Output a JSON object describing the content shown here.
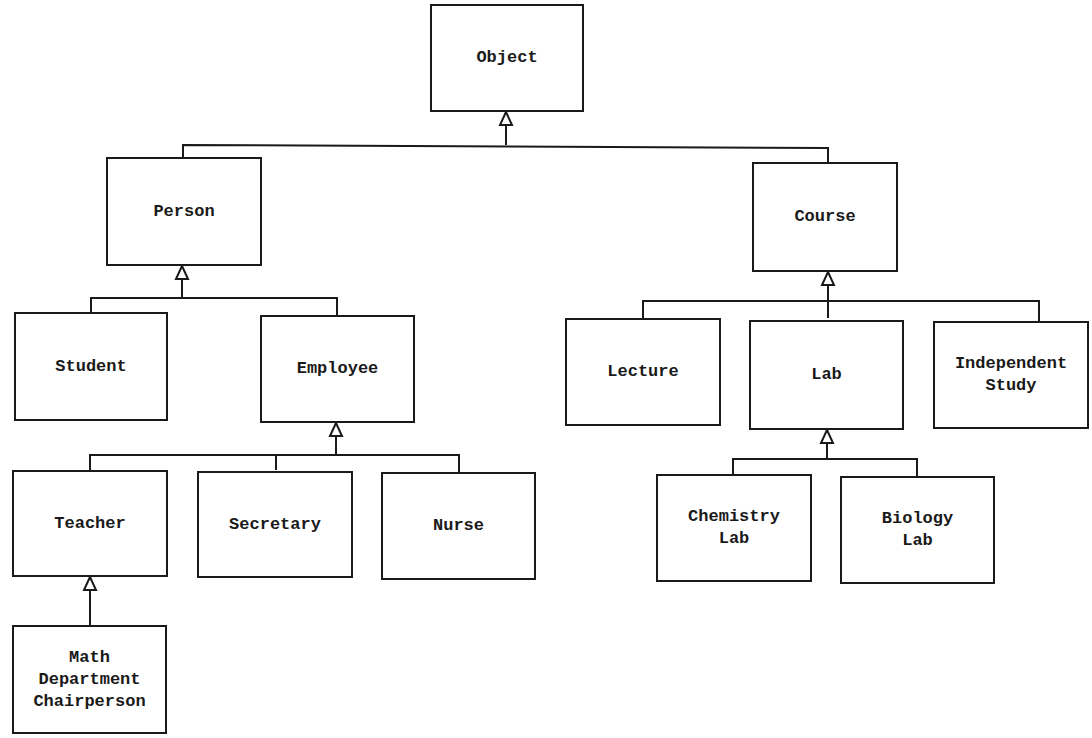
{
  "diagram": {
    "type": "class-hierarchy",
    "nodes": [
      {
        "id": "object",
        "label": "Object",
        "parent": null
      },
      {
        "id": "person",
        "label": "Person",
        "parent": "object"
      },
      {
        "id": "course",
        "label": "Course",
        "parent": "object"
      },
      {
        "id": "student",
        "label": "Student",
        "parent": "person"
      },
      {
        "id": "employee",
        "label": "Employee",
        "parent": "person"
      },
      {
        "id": "teacher",
        "label": "Teacher",
        "parent": "employee"
      },
      {
        "id": "secretary",
        "label": "Secretary",
        "parent": "employee"
      },
      {
        "id": "nurse",
        "label": "Nurse",
        "parent": "employee"
      },
      {
        "id": "math_chair",
        "label": "Math\nDepartment\nChairperson",
        "parent": "teacher"
      },
      {
        "id": "lecture",
        "label": "Lecture",
        "parent": "course"
      },
      {
        "id": "lab",
        "label": "Lab",
        "parent": "course"
      },
      {
        "id": "independent_study",
        "label": "Independent\nStudy",
        "parent": "course"
      },
      {
        "id": "chemistry_lab",
        "label": "Chemistry\nLab",
        "parent": "lab"
      },
      {
        "id": "biology_lab",
        "label": "Biology\nLab",
        "parent": "lab"
      }
    ],
    "edge_style": "inheritance-hollow-triangle"
  }
}
